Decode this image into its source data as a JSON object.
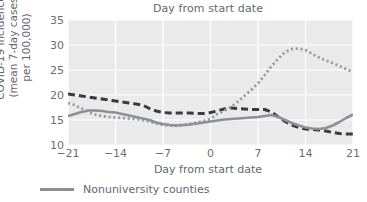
{
  "chart_data": {
    "type": "line",
    "title": "Day from start date",
    "xlabel": "Day from start date",
    "ylabel": "COVID-19 incidence\n(mean 7-day cases\nper 100,000)",
    "xlim": [
      -21,
      21
    ],
    "ylim": [
      10,
      35
    ],
    "xticks": [
      -21,
      -14,
      -7,
      0,
      7,
      14,
      21
    ],
    "xtick_labels": [
      "−21",
      "−14",
      "−7",
      "0",
      "7",
      "14",
      "21"
    ],
    "yticks": [
      10,
      15,
      20,
      25,
      30,
      35
    ],
    "ytick_labels": [
      "10",
      "15",
      "20",
      "25",
      "30",
      "35"
    ],
    "grid": true,
    "grid_color": "#ffffff",
    "plot_background": "#eaeaea",
    "legend_position": "below-axes-left",
    "legend": [
      {
        "name": "Nonuniversity counties",
        "style": "solid",
        "color": "#8c9094"
      }
    ],
    "x": [
      -21,
      -20,
      -19,
      -18,
      -17,
      -16,
      -15,
      -14,
      -13,
      -12,
      -11,
      -10,
      -9,
      -8,
      -7,
      -6,
      -5,
      -4,
      -3,
      -2,
      -1,
      0,
      1,
      2,
      3,
      4,
      5,
      6,
      7,
      8,
      9,
      10,
      11,
      12,
      13,
      14,
      15,
      16,
      17,
      18,
      19,
      20,
      21
    ],
    "series": [
      {
        "name": "series-dashed",
        "style": "dashed",
        "color": "#3b3b3b",
        "values": [
          20.2,
          20.0,
          19.8,
          19.6,
          19.4,
          19.2,
          19.0,
          18.8,
          18.6,
          18.4,
          18.2,
          18.0,
          17.3,
          16.8,
          16.5,
          16.4,
          16.4,
          16.4,
          16.4,
          16.3,
          16.3,
          16.5,
          16.8,
          17.2,
          17.4,
          17.3,
          17.2,
          17.1,
          17.1,
          17.1,
          16.6,
          15.6,
          14.7,
          14.0,
          13.5,
          13.2,
          13.1,
          13.0,
          12.8,
          12.5,
          12.3,
          12.2,
          12.2
        ]
      },
      {
        "name": "series-dotted",
        "style": "dotted",
        "color": "#9a9ea2",
        "values": [
          18.4,
          18.0,
          17.3,
          16.6,
          16.1,
          15.8,
          15.6,
          15.5,
          15.4,
          15.3,
          15.2,
          15.0,
          14.7,
          14.3,
          14.0,
          13.9,
          13.9,
          14.0,
          14.2,
          14.5,
          14.8,
          15.2,
          16.2,
          16.8,
          17.6,
          18.6,
          19.8,
          21.0,
          22.3,
          24.0,
          25.8,
          27.3,
          28.6,
          29.2,
          29.3,
          29.0,
          28.2,
          27.5,
          26.9,
          26.4,
          25.8,
          25.2,
          24.6
        ]
      },
      {
        "name": "series-solid-nonuniversity",
        "style": "solid",
        "color": "#8c9094",
        "values": [
          15.8,
          16.2,
          16.6,
          16.9,
          16.9,
          16.8,
          16.6,
          16.5,
          16.2,
          15.9,
          15.6,
          15.3,
          15.0,
          14.5,
          14.2,
          14.0,
          13.9,
          14.0,
          14.1,
          14.3,
          14.5,
          14.7,
          14.9,
          15.1,
          15.2,
          15.3,
          15.4,
          15.5,
          15.6,
          15.8,
          16.0,
          15.6,
          15.0,
          14.4,
          13.9,
          13.5,
          13.3,
          13.2,
          13.4,
          13.9,
          14.6,
          15.4,
          16.1
        ]
      }
    ]
  }
}
